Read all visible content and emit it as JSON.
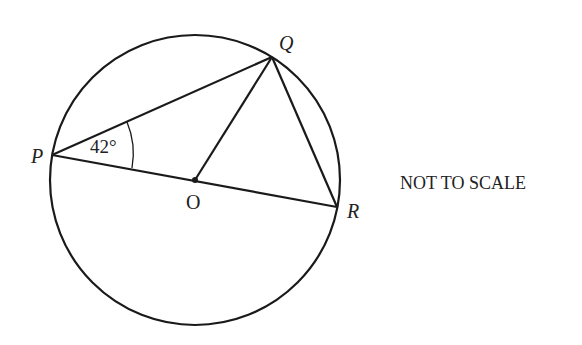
{
  "diagram": {
    "points": {
      "P": {
        "label": "P",
        "x": 52,
        "y": 155
      },
      "Q": {
        "label": "Q",
        "x": 272,
        "y": 57
      },
      "R": {
        "label": "R",
        "x": 337,
        "y": 207
      },
      "O": {
        "label": "O",
        "x": 195,
        "y": 180
      }
    },
    "circle": {
      "cx": 195,
      "cy": 180,
      "r": 145
    },
    "angle_label": "42°",
    "note": "NOT TO SCALE",
    "stroke_color": "#1a1a1a"
  }
}
